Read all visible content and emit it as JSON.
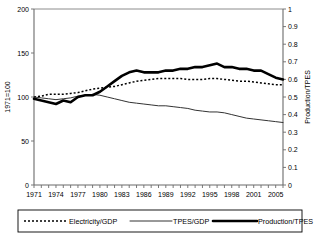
{
  "chart_data": {
    "type": "line",
    "title": "",
    "xlabel": "",
    "ylabel": "1971=100",
    "y2label": "Production/TPES",
    "ylim": [
      0,
      200
    ],
    "y2lim": [
      0,
      1
    ],
    "grid": false,
    "legend_position": "bottom",
    "yticks": [
      "0",
      "50",
      "100",
      "150",
      "200"
    ],
    "y2ticks": [
      "0",
      "0.1",
      "0.2",
      "0.3",
      "0.4",
      "0.5",
      "0.6",
      "0.7",
      "0.8",
      "0.9",
      "1"
    ],
    "xticks": [
      "1971",
      "1974",
      "1977",
      "1980",
      "1983",
      "1986",
      "1989",
      "1992",
      "1995",
      "1998",
      "2001",
      "2005"
    ],
    "x": [
      1971,
      1972,
      1973,
      1974,
      1975,
      1976,
      1977,
      1978,
      1979,
      1980,
      1981,
      1982,
      1983,
      1984,
      1985,
      1986,
      1987,
      1988,
      1989,
      1990,
      1991,
      1992,
      1993,
      1994,
      1995,
      1996,
      1997,
      1998,
      1999,
      2000,
      2001,
      2002,
      2003,
      2004,
      2005
    ],
    "series": [
      {
        "name": "Electricity/GDP",
        "style": "dotted",
        "axis": "left",
        "values": [
          100,
          101,
          103,
          103,
          103,
          104,
          105,
          107,
          109,
          110,
          111,
          112,
          114,
          116,
          118,
          119,
          120,
          121,
          121,
          121,
          121,
          120,
          120,
          120,
          121,
          121,
          120,
          119,
          118,
          118,
          117,
          116,
          115,
          114,
          114
        ]
      },
      {
        "name": "TPES/GDP",
        "style": "thin",
        "axis": "left",
        "values": [
          100,
          99,
          98,
          97,
          98,
          99,
          101,
          102,
          103,
          102,
          100,
          98,
          96,
          94,
          93,
          92,
          91,
          90,
          90,
          89,
          88,
          87,
          85,
          84,
          83,
          83,
          82,
          80,
          78,
          76,
          75,
          74,
          73,
          72,
          71
        ]
      },
      {
        "name": "Production/TPES",
        "style": "thick",
        "axis": "right",
        "values": [
          0.49,
          0.48,
          0.47,
          0.46,
          0.48,
          0.47,
          0.5,
          0.51,
          0.51,
          0.53,
          0.56,
          0.59,
          0.62,
          0.64,
          0.65,
          0.64,
          0.64,
          0.64,
          0.65,
          0.65,
          0.66,
          0.66,
          0.67,
          0.67,
          0.68,
          0.69,
          0.67,
          0.67,
          0.66,
          0.66,
          0.65,
          0.65,
          0.63,
          0.61,
          0.6
        ]
      }
    ]
  },
  "legend": {
    "items": [
      {
        "label": "Electricity/GDP",
        "style": "dotted"
      },
      {
        "label": "TPES/GDP",
        "style": "thin"
      },
      {
        "label": "Production/TPES",
        "style": "thick"
      }
    ]
  }
}
